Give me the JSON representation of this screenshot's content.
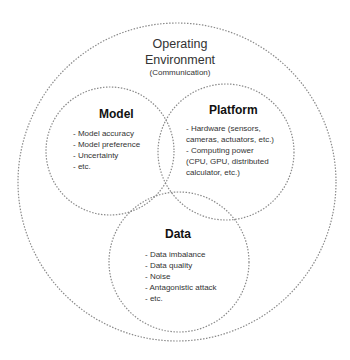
{
  "diagram": {
    "outer": {
      "title_line1": "Operating",
      "title_line2": "Environment",
      "subtitle": "(Communication)"
    },
    "model": {
      "title": "Model",
      "items": [
        "- Model accuracy",
        "- Model preference",
        "- Uncertainty",
        "- etc."
      ]
    },
    "platform": {
      "title": "Platform",
      "items": [
        "- Hardware (sensors,",
        "cameras, actuators, etc.)",
        "- Computing power",
        "(CPU, GPU, distributed",
        "calculator, etc.)"
      ]
    },
    "data": {
      "title": "Data",
      "items": [
        "- Data imbalance",
        "- Data quality",
        "- Noise",
        "- Antagonistic attack",
        "- etc."
      ]
    },
    "colors": {
      "background": "#ffffff",
      "circle_stroke": "#8a8a8a",
      "text": "#333333"
    }
  }
}
